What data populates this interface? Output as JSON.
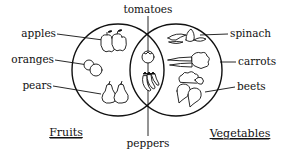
{
  "diagram": {
    "type": "venn",
    "sets": [
      {
        "name": "Fruits",
        "members": [
          "apples",
          "oranges",
          "pears"
        ]
      },
      {
        "name": "Vegetables",
        "members": [
          "spinach",
          "carrots",
          "beets"
        ]
      }
    ],
    "intersection": {
      "members": [
        "tomatoes",
        "peppers"
      ]
    },
    "labels": {
      "apples": "apples",
      "oranges": "oranges",
      "pears": "pears",
      "spinach": "spinach",
      "carrots": "carrots",
      "beets": "beets",
      "tomatoes": "tomatoes",
      "peppers": "peppers",
      "fruits": "Fruits",
      "vegetables": "Vegetables"
    },
    "icons": {
      "apples": "apple-pair-icon",
      "oranges": "orange-pair-icon",
      "pears": "pear-pair-icon",
      "spinach": "spinach-icon",
      "carrots": "carrot-pair-icon",
      "beets": "beet-pair-icon",
      "tomatoes": "tomato-icon",
      "peppers": "pepper-bunch-icon"
    },
    "colors": {
      "ink": "#111111",
      "background": "#ffffff"
    }
  }
}
